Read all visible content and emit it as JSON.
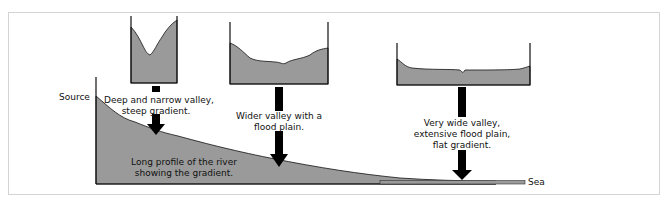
{
  "diagram": {
    "colors": {
      "fill": "#9a9a9a",
      "line": "#111111",
      "arrow": "#000000",
      "frame": "#d4d4d4"
    },
    "axis_labels": {
      "source": "Source",
      "sea": "Sea"
    },
    "profile_label": {
      "line1": "Long profile of the river",
      "line2": "showing the gradient."
    },
    "stages": [
      {
        "name": "upper",
        "line1": "Deep and narrow valley,",
        "line2": "steep gradient.",
        "line3": ""
      },
      {
        "name": "middle",
        "line1": "Wider valley with a",
        "line2": "flood plain.",
        "line3": ""
      },
      {
        "name": "lower",
        "line1": "Very wide valley,",
        "line2": "extensive flood plain,",
        "line3": "flat gradient."
      }
    ]
  }
}
